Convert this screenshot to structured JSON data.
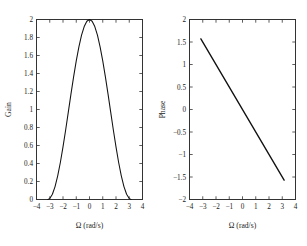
{
  "figure": {
    "background_color": "#ffffff",
    "axis_color": "#222222",
    "curve_color": "#111111",
    "text_color": "#1a1a1a",
    "panel_count": 2
  },
  "chart_data": [
    {
      "type": "line",
      "title": "",
      "name": "gain-plot",
      "xlabel": "Ω (rad/s)",
      "ylabel": "Gain",
      "xlim": [
        -4,
        4
      ],
      "ylim": [
        0,
        2
      ],
      "grid": false,
      "legend": null,
      "xticks": [
        -4,
        -3,
        -2,
        -1,
        0,
        1,
        2,
        3,
        4
      ],
      "xticklabels": [
        "−4",
        "−3",
        "−2",
        "−1",
        "0",
        "1",
        "2",
        "3",
        "4"
      ],
      "yticks": [
        0,
        0.2,
        0.4,
        0.6,
        0.8,
        1,
        1.2,
        1.4,
        1.6,
        1.8,
        2
      ],
      "yticklabels": [
        "0",
        "0.2",
        "0.4",
        "0.6",
        "0.8",
        "1",
        "1.2",
        "1.4",
        "1.6",
        "1.8",
        "2"
      ],
      "series": [
        {
          "name": "gain",
          "expression": "1 + cos(Ω)",
          "x": [
            -3.1416,
            -3.0,
            -2.8,
            -2.6,
            -2.4,
            -2.2,
            -2.0,
            -1.8,
            -1.6,
            -1.4,
            -1.2,
            -1.0,
            -0.8,
            -0.6,
            -0.4,
            -0.2,
            0.0,
            0.2,
            0.4,
            0.6,
            0.8,
            1.0,
            1.2,
            1.4,
            1.6,
            1.8,
            2.0,
            2.2,
            2.4,
            2.6,
            2.8,
            3.0,
            3.1416
          ],
          "y": [
            0.0,
            0.01,
            0.0579,
            0.1433,
            0.2627,
            0.4112,
            0.5839,
            0.7725,
            0.9707,
            1.17,
            1.3624,
            1.5403,
            1.6967,
            1.8253,
            1.9211,
            1.9801,
            2.0,
            1.9801,
            1.9211,
            1.8253,
            1.6967,
            1.5403,
            1.3624,
            1.17,
            0.9707,
            0.7725,
            0.5839,
            0.4112,
            0.2627,
            0.1433,
            0.0579,
            0.01,
            0.0
          ]
        }
      ]
    },
    {
      "type": "line",
      "title": "",
      "name": "phase-plot",
      "xlabel": "Ω (rad/s)",
      "ylabel": "Phase",
      "xlim": [
        -4,
        4
      ],
      "ylim": [
        -2,
        2
      ],
      "grid": false,
      "legend": null,
      "xticks": [
        -4,
        -3,
        -2,
        -1,
        0,
        1,
        2,
        3,
        4
      ],
      "xticklabels": [
        "−4",
        "−3",
        "−2",
        "−1",
        "0",
        "1",
        "2",
        "3",
        "4"
      ],
      "yticks": [
        -2,
        -1.5,
        -1,
        -0.5,
        0,
        0.5,
        1,
        1.5,
        2
      ],
      "yticklabels": [
        "−2",
        "−1.5",
        "−1",
        "−0.5",
        "0",
        "0.5",
        "1",
        "1.5",
        "2"
      ],
      "series": [
        {
          "name": "phase",
          "expression": "-Ω/2",
          "x": [
            -3.1416,
            3.1416
          ],
          "y": [
            1.5708,
            -1.5708
          ]
        }
      ]
    }
  ]
}
